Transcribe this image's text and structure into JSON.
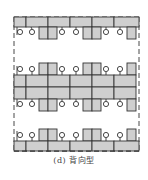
{
  "figure": {
    "caption": "(d) 背向型",
    "layout_type": "back-to-back office desk arrangement",
    "colors": {
      "desk_fill": "#cfcfcf",
      "line": "#333333",
      "background": "#ffffff"
    },
    "elements": {
      "boundary": "dashed rectangle",
      "desk_rows": [
        {
          "name": "top-wall-row",
          "position": "along top dashed boundary",
          "chairs": "below"
        },
        {
          "name": "center-double-row",
          "position": "middle, back-to-back",
          "chairs": "above and below"
        },
        {
          "name": "bottom-wall-row",
          "position": "along bottom dashed boundary",
          "chairs": "above"
        }
      ],
      "chair_symbol": "circle with stem (workstation chair)",
      "desk_symbol": "grey rectangle"
    }
  }
}
